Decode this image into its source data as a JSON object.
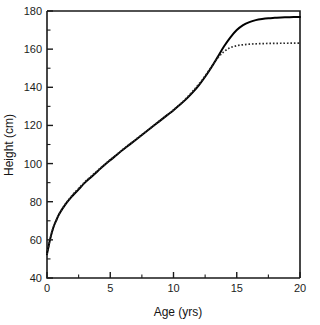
{
  "chart_data": {
    "type": "line",
    "title": "",
    "xlabel": "Age (yrs)",
    "ylabel": "Height (cm)",
    "xlim": [
      0,
      20
    ],
    "ylim": [
      40,
      180
    ],
    "grid": false,
    "legend": null,
    "x_ticks": [
      0,
      5,
      10,
      15,
      20
    ],
    "x_tick_labels": [
      "0",
      "5",
      "10",
      "15",
      "20"
    ],
    "x_minor_ticks": [
      2.5,
      7.5,
      12.5,
      17.5
    ],
    "y_ticks": [
      40,
      60,
      80,
      100,
      120,
      140,
      160,
      180
    ],
    "y_tick_labels": [
      "40",
      "60",
      "80",
      "100",
      "120",
      "140",
      "160",
      "180"
    ],
    "y_minor_ticks": [
      50,
      70,
      90,
      110,
      130,
      150,
      170
    ],
    "series": [
      {
        "name": "solid-growth-curve",
        "style": "solid",
        "color": "#000000",
        "x": [
          0,
          0.25,
          0.5,
          0.75,
          1,
          1.5,
          2,
          2.5,
          3,
          3.5,
          4,
          4.5,
          5,
          5.5,
          6,
          6.5,
          7,
          7.5,
          8,
          8.5,
          9,
          9.5,
          10,
          10.5,
          11,
          11.5,
          12,
          12.5,
          13,
          13.5,
          14,
          14.5,
          15,
          15.5,
          16,
          16.5,
          17,
          17.5,
          18,
          18.5,
          19,
          19.5,
          20
        ],
        "y": [
          52.5,
          60.5,
          66.5,
          70.5,
          74.0,
          79.0,
          83.0,
          86.5,
          90.0,
          93.0,
          96.0,
          99.0,
          101.8,
          104.5,
          107.2,
          109.8,
          112.4,
          115.0,
          117.6,
          120.2,
          122.8,
          125.4,
          128.0,
          130.8,
          133.8,
          137.2,
          141.0,
          145.5,
          150.5,
          156.0,
          161.5,
          166.2,
          170.0,
          172.6,
          174.2,
          175.2,
          175.8,
          176.2,
          176.4,
          176.6,
          176.7,
          176.8,
          176.8
        ]
      },
      {
        "name": "dotted-growth-curve",
        "style": "dotted",
        "color": "#2b2b2b",
        "x": [
          0,
          0.25,
          0.5,
          0.75,
          1,
          1.5,
          2,
          2.5,
          3,
          3.5,
          4,
          4.5,
          5,
          5.5,
          6,
          6.5,
          7,
          7.5,
          8,
          8.5,
          9,
          9.5,
          10,
          10.5,
          11,
          11.5,
          12,
          12.5,
          13,
          13.5,
          14,
          14.5,
          15,
          15.5,
          16,
          16.5,
          17,
          17.5,
          18,
          18.5,
          19,
          19.5,
          20
        ],
        "y": [
          52.5,
          60.5,
          66.5,
          70.5,
          74.0,
          79.2,
          83.4,
          87.0,
          90.4,
          93.4,
          96.4,
          99.2,
          102.0,
          104.7,
          107.4,
          110.0,
          112.6,
          115.1,
          117.7,
          120.3,
          122.9,
          125.5,
          128.1,
          131.0,
          134.2,
          137.8,
          141.6,
          146.0,
          150.8,
          155.4,
          158.8,
          160.8,
          161.8,
          162.3,
          162.6,
          162.8,
          162.9,
          163.0,
          163.0,
          163.1,
          163.1,
          163.2,
          163.2
        ]
      }
    ],
    "annotations": []
  },
  "layout": {
    "plot_left": 47,
    "plot_top": 11,
    "plot_right": 300,
    "plot_bottom": 278
  }
}
